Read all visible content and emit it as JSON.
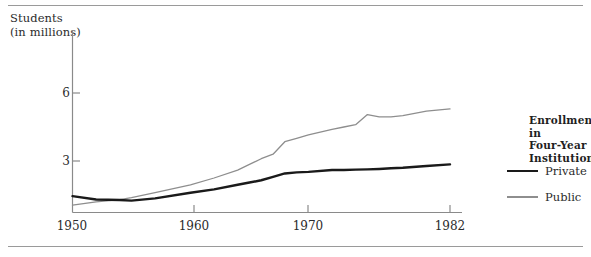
{
  "figure": {
    "name": "enrollment-line-chart",
    "y_axis_title": "Students\n(in millions)"
  },
  "legend": {
    "title": "Enrollment in\nFour-Year\nInstitutions",
    "entries": [
      {
        "label": "Private",
        "color": "#1a1a1a",
        "width": 2.6
      },
      {
        "label": "Public",
        "color": "#8e8e8e",
        "width": 1.3
      }
    ]
  },
  "chart_data": {
    "type": "line",
    "title": "",
    "subtitle": "",
    "xlabel": "",
    "ylabel": "Students (in millions)",
    "xlim": [
      1950,
      1982
    ],
    "ylim": [
      0.75,
      6.75
    ],
    "xticks": [
      1950,
      1960,
      1970,
      1982
    ],
    "xtick_labels": [
      "1950",
      "1960",
      "1970",
      "1982"
    ],
    "yticks": [
      3,
      6
    ],
    "ytick_labels": [
      "3",
      "6"
    ],
    "grid": false,
    "legend_position": "right",
    "x": [
      1950,
      1952,
      1954,
      1955,
      1957,
      1960,
      1962,
      1964,
      1965,
      1966,
      1967,
      1968,
      1969,
      1970,
      1972,
      1973,
      1974,
      1975,
      1976,
      1977,
      1978,
      1980,
      1982
    ],
    "series": [
      {
        "name": "Private",
        "color": "#1a1a1a",
        "values": [
          1.45,
          1.3,
          1.28,
          1.25,
          1.35,
          1.6,
          1.75,
          1.95,
          2.05,
          2.15,
          2.3,
          2.45,
          2.5,
          2.52,
          2.6,
          2.6,
          2.62,
          2.63,
          2.65,
          2.68,
          2.7,
          2.78,
          2.85
        ]
      },
      {
        "name": "Public",
        "color": "#8e8e8e",
        "values": [
          1.05,
          1.2,
          1.3,
          1.38,
          1.6,
          1.95,
          2.25,
          2.6,
          2.85,
          3.1,
          3.3,
          3.85,
          4.0,
          4.15,
          4.4,
          4.5,
          4.6,
          5.05,
          4.95,
          4.95,
          5.0,
          5.2,
          5.3
        ]
      }
    ]
  }
}
